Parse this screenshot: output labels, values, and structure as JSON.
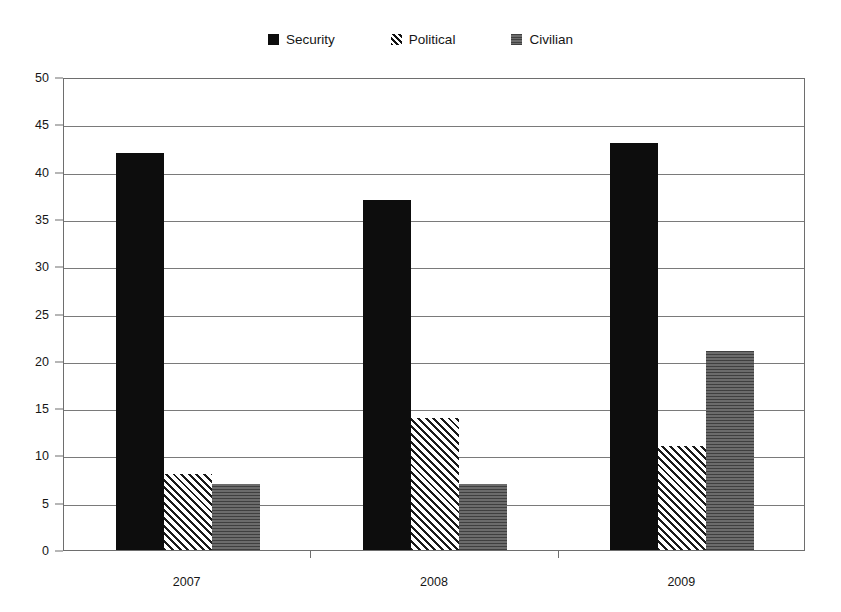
{
  "legend": {
    "position": "top-center",
    "items": [
      {
        "label": "Security",
        "marker": "solid-square-black",
        "swatch_class": "fill-security",
        "color": "#0d0d0d"
      },
      {
        "label": "Political",
        "marker": "diagonal-hatch-square",
        "swatch_class": "fill-political",
        "color": "#111111"
      },
      {
        "label": "Civilian",
        "marker": "gray-textured-square",
        "swatch_class": "fill-civilian",
        "color": "#5c5c5c"
      }
    ]
  },
  "axes": {
    "y_ticks": [
      0,
      5,
      10,
      15,
      20,
      25,
      30,
      35,
      40,
      45,
      50
    ],
    "x_ticks": [
      "2007",
      "2008",
      "2009"
    ]
  },
  "chart_data": {
    "type": "bar",
    "title": "",
    "subtitle": "",
    "xlabel": "",
    "ylabel": "",
    "categories": [
      "2007",
      "2008",
      "2009"
    ],
    "series": [
      {
        "name": "Security",
        "values": [
          42,
          37,
          43
        ],
        "color": "#0d0d0d",
        "pattern": "solid"
      },
      {
        "name": "Political",
        "values": [
          8,
          14,
          11
        ],
        "color": "#111111",
        "pattern": "diagonal-hatch"
      },
      {
        "name": "Civilian",
        "values": [
          7,
          7,
          21
        ],
        "color": "#585858",
        "pattern": "horizontal-texture"
      }
    ],
    "ylim": [
      0,
      50
    ],
    "ytick_step": 5,
    "grid": true,
    "grid_axis": "y",
    "legend": true,
    "legend_position": "top-center",
    "grouping": "clustered"
  }
}
